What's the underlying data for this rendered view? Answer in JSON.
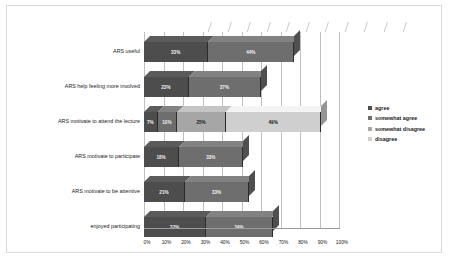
{
  "chart_data": {
    "type": "bar",
    "subtype": "stacked-horizontal-3d",
    "title": "",
    "xlabel": "",
    "ylabel": "",
    "xlim": [
      0,
      100
    ],
    "xticks": [
      "0%",
      "10%",
      "20%",
      "30%",
      "40%",
      "50%",
      "60%",
      "70%",
      "80%",
      "90%",
      "100%"
    ],
    "grid": true,
    "legend_position": "right",
    "categories": [
      "ARS useful",
      "ARS help feeling more involved",
      "ARS motivate to attend the lecture",
      "ARS motivate to participate",
      "ARS motivate to be attentive",
      "enjoyed participating"
    ],
    "series": [
      {
        "name": "agree",
        "color": "#4d4d4d",
        "values": [
          33,
          23,
          7,
          18,
          21,
          32
        ],
        "labels": [
          "33%",
          "23%",
          "7%",
          "18%",
          "21%",
          "32%"
        ]
      },
      {
        "name": "somewhat agree",
        "color": "#6e6e6e",
        "values": [
          44,
          37,
          10,
          33,
          33,
          34
        ],
        "labels": [
          "44%",
          "37%",
          "10%",
          "33%",
          "33%",
          "34%"
        ]
      },
      {
        "name": "somewhat disagree",
        "color": "#a6a6a6",
        "values": [
          0,
          0,
          25,
          0,
          0,
          0
        ],
        "labels": [
          "",
          "",
          "25%",
          "",
          "",
          ""
        ]
      },
      {
        "name": "disagree",
        "color": "#cfcfcf",
        "values": [
          0,
          0,
          49,
          0,
          0,
          0
        ],
        "labels": [
          "",
          "",
          "49%",
          "",
          "",
          ""
        ]
      }
    ]
  },
  "legend": {
    "items": [
      {
        "label": "agree",
        "color": "#4d4d4d"
      },
      {
        "label": "somewhat agree",
        "color": "#6e6e6e"
      },
      {
        "label": "somewhat disagree",
        "color": "#a6a6a6"
      },
      {
        "label": "disagree",
        "color": "#cfcfcf"
      }
    ]
  }
}
